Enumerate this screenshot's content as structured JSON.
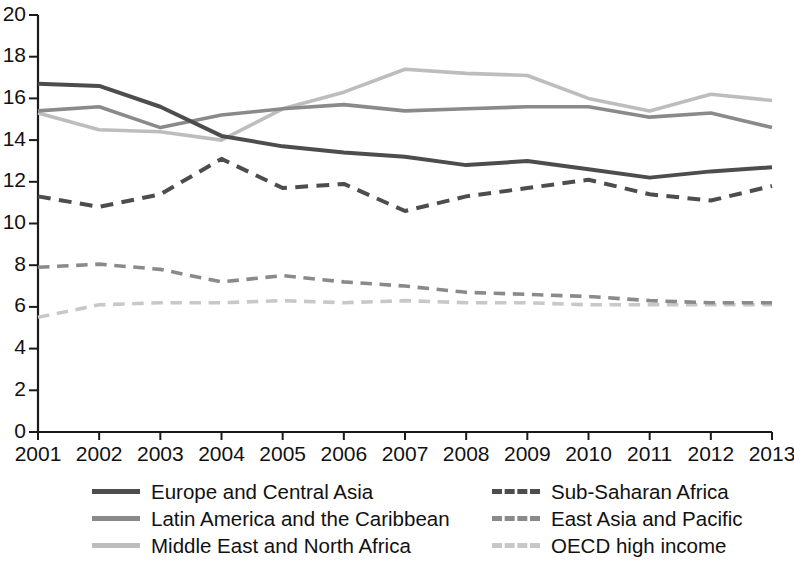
{
  "chart_data": {
    "type": "line",
    "title": "",
    "subtitle": "",
    "xlabel": "",
    "ylabel": "",
    "xlim": [
      2001,
      2013
    ],
    "ylim": [
      0,
      20
    ],
    "ytick_step": 2,
    "grid": false,
    "legend_position": "bottom",
    "x": [
      2001,
      2002,
      2003,
      2004,
      2005,
      2006,
      2007,
      2008,
      2009,
      2010,
      2011,
      2012,
      2013
    ],
    "xtick_labels": [
      "2001",
      "2002",
      "2003",
      "2004",
      "2005",
      "2006",
      "2007",
      "2008",
      "2009",
      "2010",
      "2011",
      "2012",
      "2013"
    ],
    "ytick_labels": [
      "0",
      "2",
      "4",
      "6",
      "8",
      "10",
      "12",
      "14",
      "16",
      "18",
      "20"
    ],
    "ytick_values": [
      0,
      2,
      4,
      6,
      8,
      10,
      12,
      14,
      16,
      18,
      20
    ],
    "series": [
      {
        "name": "Europe and Central Asia",
        "color": "#4d4d4d",
        "style": "solid",
        "width": 4.0,
        "values": [
          16.7,
          16.6,
          15.6,
          14.2,
          13.7,
          13.4,
          13.2,
          12.8,
          13.0,
          12.6,
          12.2,
          12.5,
          12.7
        ]
      },
      {
        "name": "Latin America and the Caribbean",
        "color": "#8a8a8a",
        "style": "solid",
        "width": 3.6,
        "values": [
          15.4,
          15.6,
          14.6,
          15.2,
          15.5,
          15.7,
          15.4,
          15.5,
          15.6,
          15.6,
          15.1,
          15.3,
          14.6
        ]
      },
      {
        "name": "Middle East and North Africa",
        "color": "#bdbdbd",
        "style": "solid",
        "width": 3.6,
        "values": [
          15.3,
          14.5,
          14.4,
          14.0,
          15.5,
          16.3,
          17.4,
          17.2,
          17.1,
          16.0,
          15.4,
          16.2,
          15.9
        ]
      },
      {
        "name": "Sub-Saharan Africa",
        "color": "#4d4d4d",
        "style": "dashed",
        "width": 4.0,
        "values": [
          11.3,
          10.8,
          11.4,
          13.1,
          11.7,
          11.9,
          10.6,
          11.3,
          11.7,
          12.1,
          11.4,
          11.1,
          11.8
        ]
      },
      {
        "name": "East Asia and Pacific",
        "color": "#8a8a8a",
        "style": "dashed",
        "width": 3.6,
        "values": [
          7.9,
          8.05,
          7.8,
          7.2,
          7.5,
          7.2,
          7.0,
          6.7,
          6.6,
          6.5,
          6.3,
          6.2,
          6.2
        ]
      },
      {
        "name": "OECD high income",
        "color": "#c8c8c8",
        "style": "dashed",
        "width": 3.6,
        "values": [
          5.5,
          6.1,
          6.2,
          6.2,
          6.3,
          6.2,
          6.3,
          6.2,
          6.2,
          6.1,
          6.1,
          6.1,
          6.1
        ]
      }
    ]
  },
  "legend": {
    "entries": [
      {
        "label": "Europe and Central Asia",
        "color": "#4d4d4d",
        "style": "solid"
      },
      {
        "label": "Sub-Saharan Africa",
        "color": "#4d4d4d",
        "style": "dashed"
      },
      {
        "label": "Latin America and the Caribbean",
        "color": "#8a8a8a",
        "style": "solid"
      },
      {
        "label": "East Asia and Pacific",
        "color": "#8a8a8a",
        "style": "dashed"
      },
      {
        "label": "Middle East and North Africa",
        "color": "#bdbdbd",
        "style": "solid"
      },
      {
        "label": "OECD high income",
        "color": "#c8c8c8",
        "style": "dashed"
      }
    ]
  }
}
